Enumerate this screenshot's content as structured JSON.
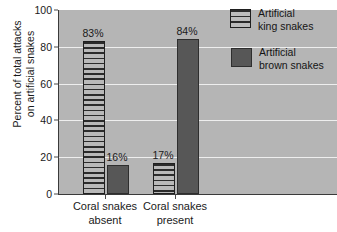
{
  "chart_data": {
    "type": "bar",
    "title": "",
    "xlabel": "",
    "ylabel": "Percent of total attacks on artificial snakes",
    "ylabel_line1": "Percent of total attacks",
    "ylabel_line2": "on artificial snakes",
    "categories": [
      "Coral snakes absent",
      "Coral snakes present"
    ],
    "category_lines": [
      {
        "line1": "Coral snakes",
        "line2": "absent"
      },
      {
        "line1": "Coral snakes",
        "line2": "present"
      }
    ],
    "series": [
      {
        "name": "Artificial king snakes",
        "name_line1": "Artificial",
        "name_line2": "king snakes",
        "values": [
          83,
          17
        ],
        "labels": [
          "83%",
          "17%"
        ],
        "fill": "striped",
        "color": "#a8a8a8"
      },
      {
        "name": "Artificial brown snakes",
        "name_line1": "Artificial",
        "name_line2": "brown snakes",
        "values": [
          16,
          84
        ],
        "labels": [
          "16%",
          "84%"
        ],
        "fill": "solid",
        "color": "#575757"
      }
    ],
    "bar_order_by_group": [
      [
        "Artificial king snakes",
        "Artificial brown snakes"
      ],
      [
        "Artificial king snakes",
        "Artificial brown snakes"
      ]
    ],
    "ylim": [
      0,
      100
    ],
    "ytick_labels": [
      "0",
      "20",
      "40",
      "60",
      "80",
      "100"
    ],
    "ytick_values": [
      0,
      20,
      40,
      60,
      80,
      100
    ],
    "grid": true,
    "grid_axis": "y",
    "legend_position": "top-right",
    "plot_background": "#b5b5b5",
    "gridline_color": "#eeeeee",
    "axis_color": "#3a3a3a"
  }
}
